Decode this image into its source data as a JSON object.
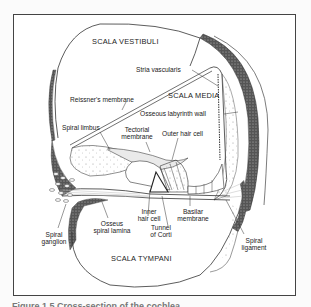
{
  "figure": {
    "regions": {
      "scala_vestibuli": "SCALA VESTIBULI",
      "scala_media": "SCALA MEDIA",
      "scala_tympani": "SCALA TYMPANI"
    },
    "labels": {
      "stria_vascularis": "Stria vascularis",
      "reissners_membrane": "Reissner's membrane",
      "osseous_labyrinth_wall": "Osseous labyrinth wall",
      "spiral_limbus": "Spiral limbus",
      "tectorial_membrane_1": "Tectorial",
      "tectorial_membrane_2": "membrane",
      "outer_hair_cell": "Outer hair cell",
      "inner_hair_cell_1": "Inner",
      "inner_hair_cell_2": "hair cell",
      "basilar_membrane_1": "Basilar",
      "basilar_membrane_2": "membrane",
      "tunnel_of_corti_1": "Tunnel",
      "tunnel_of_corti_2": "of Corti",
      "osseous_spiral_lamina_1": "Osseus",
      "osseous_spiral_lamina_2": "spiral lamina",
      "spiral_ganglion_1": "Spiral",
      "spiral_ganglion_2": "ganglion",
      "spiral_ligament_1": "Spiral",
      "spiral_ligament_2": "ligament"
    },
    "caption": "Figure 1.5  Cross-section of the cochlea"
  }
}
